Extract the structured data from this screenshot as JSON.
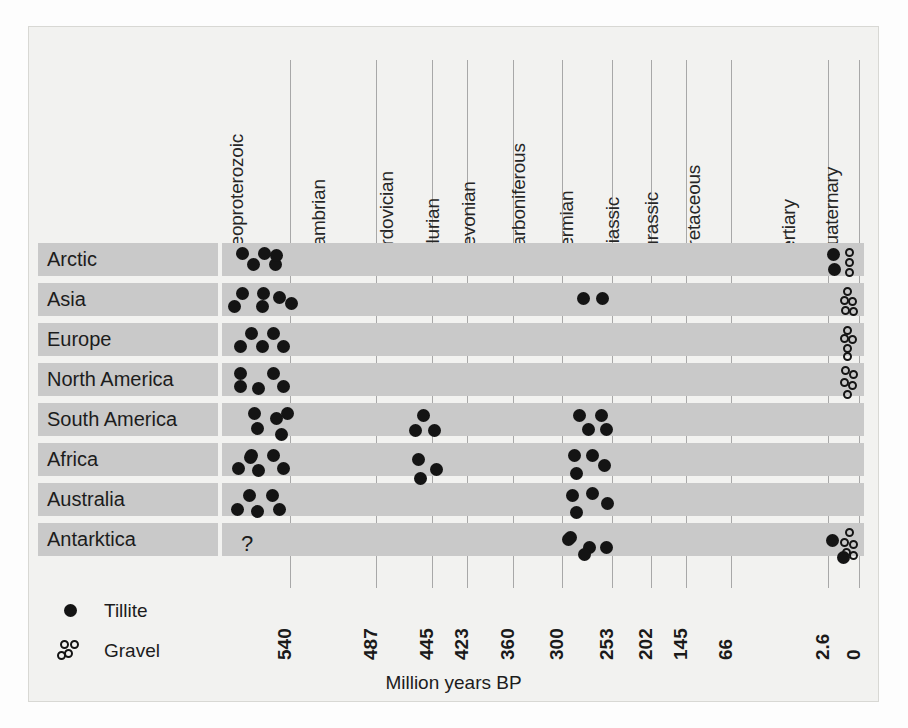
{
  "chart_data": {
    "type": "scatter",
    "title": "",
    "xlabel": "Million years BP",
    "ylabel": "",
    "grid": true,
    "legend_position": "bottom-left",
    "x_axis": {
      "label": "Million years BP",
      "direction": "reversed",
      "ticks": [
        "540",
        "487",
        "445",
        "423",
        "360",
        "300",
        "253",
        "202",
        "145",
        "66",
        "2.6",
        "0"
      ],
      "tick_values": [
        540,
        487,
        445,
        423,
        360,
        300,
        253,
        202,
        145,
        66,
        2.6,
        0
      ]
    },
    "periods": [
      "Neoproterozoic",
      "Cambrian",
      "Ordovician",
      "Silurian",
      "Devonian",
      "Carboniferous",
      "Permian",
      "Triassic",
      "Jurassic",
      "Cretaceous",
      "Tertiary",
      "Quaternary"
    ],
    "categories": [
      "Arctic",
      "Asia",
      "Europe",
      "North America",
      "South America",
      "Africa",
      "Australia",
      "Antarktica"
    ],
    "legend": [
      {
        "label": "Tillite",
        "marker": "filled-circle"
      },
      {
        "label": "Gravel",
        "marker": "open-circle-cluster"
      }
    ],
    "annotations": [
      {
        "row": "Antarktica",
        "period": "Neoproterozoic",
        "text": "?"
      }
    ],
    "series": [
      {
        "name": "Tillite",
        "marker": "filled-circle",
        "color": "#141414",
        "points": [
          {
            "row": "Arctic",
            "period": "Neoproterozoic",
            "count": 5
          },
          {
            "row": "Arctic",
            "period": "Quaternary",
            "count": 2
          },
          {
            "row": "Asia",
            "period": "Neoproterozoic",
            "count": 6
          },
          {
            "row": "Asia",
            "period": "Carboniferous-Permian",
            "count": 2
          },
          {
            "row": "Europe",
            "period": "Neoproterozoic",
            "count": 5
          },
          {
            "row": "North America",
            "period": "Neoproterozoic",
            "count": 5
          },
          {
            "row": "South America",
            "period": "Neoproterozoic",
            "count": 5
          },
          {
            "row": "South America",
            "period": "Ordovician-Silurian",
            "count": 3
          },
          {
            "row": "South America",
            "period": "Carboniferous-Permian",
            "count": 4
          },
          {
            "row": "Africa",
            "period": "Neoproterozoic",
            "count": 6
          },
          {
            "row": "Africa",
            "period": "Ordovician-Silurian",
            "count": 3
          },
          {
            "row": "Africa",
            "period": "Carboniferous-Permian",
            "count": 4
          },
          {
            "row": "Australia",
            "period": "Neoproterozoic",
            "count": 5
          },
          {
            "row": "Australia",
            "period": "Carboniferous-Permian",
            "count": 5
          },
          {
            "row": "Antarktica",
            "period": "Carboniferous-Permian",
            "count": 5
          },
          {
            "row": "Antarktica",
            "period": "Quaternary",
            "count": 2
          }
        ]
      },
      {
        "name": "Gravel",
        "marker": "open-circle",
        "color": "#141414",
        "points": [
          {
            "row": "Arctic",
            "period": "Quaternary",
            "count": 3
          },
          {
            "row": "Asia",
            "period": "Quaternary",
            "count": 5
          },
          {
            "row": "Europe",
            "period": "Quaternary",
            "count": 5
          },
          {
            "row": "North America",
            "period": "Quaternary",
            "count": 5
          },
          {
            "row": "Antarktica",
            "period": "Quaternary",
            "count": 5
          }
        ]
      }
    ]
  },
  "axis_title": "Million years BP",
  "legend": {
    "tillite_label": "Tillite",
    "gravel_label": "Gravel"
  },
  "periods": [
    {
      "label": "Neoproterozoic"
    },
    {
      "label": "Cambrian"
    },
    {
      "label": "Ordovician"
    },
    {
      "label": "Silurian"
    },
    {
      "label": "Devonian"
    },
    {
      "label": "Carboniferous"
    },
    {
      "label": "Permian"
    },
    {
      "label": "Triassic"
    },
    {
      "label": "Jurassic"
    },
    {
      "label": "Cretaceous"
    },
    {
      "label": "Tertiary"
    },
    {
      "label": "Quaternary"
    }
  ],
  "rows": [
    {
      "label": "Arctic"
    },
    {
      "label": "Asia"
    },
    {
      "label": "Europe"
    },
    {
      "label": "North America"
    },
    {
      "label": "South America"
    },
    {
      "label": "Africa"
    },
    {
      "label": "Australia"
    },
    {
      "label": "Antarktica"
    }
  ],
  "ticks": [
    {
      "label": "540"
    },
    {
      "label": "487"
    },
    {
      "label": "445"
    },
    {
      "label": "423"
    },
    {
      "label": "360"
    },
    {
      "label": "300"
    },
    {
      "label": "253"
    },
    {
      "label": "202"
    },
    {
      "label": "145"
    },
    {
      "label": "66"
    },
    {
      "label": "2.6"
    },
    {
      "label": "0"
    }
  ],
  "annotation_unknown": "?",
  "colors": {
    "band": "#c9c9c9",
    "marker": "#141414",
    "gridline": "#a8a8a8",
    "plate": "#f2f2f0"
  },
  "layout": {
    "period_label_x": [
      248,
      330,
      398,
      444,
      480,
      530,
      578,
      624,
      663,
      705,
      800,
      843
    ],
    "period_label_baseline": 238,
    "gridline_x": [
      290,
      376,
      432,
      467,
      513,
      562,
      612,
      651,
      686,
      731,
      828,
      859
    ],
    "gridline_top": 60,
    "gridline_bottom": 588,
    "row_top": [
      243,
      283,
      323,
      363,
      403,
      443,
      483,
      523
    ],
    "row_label_left": 38,
    "row_label_width": 180,
    "band_left": 222,
    "band_right": 864,
    "tick_x": [
      296,
      382,
      438,
      473,
      519,
      568,
      618,
      657,
      692,
      737,
      834,
      865
    ],
    "tick_baseline": 638,
    "legend_x_marker": 64,
    "legend_x_label": 104,
    "legend_y": [
      604,
      644
    ]
  },
  "markers": {
    "tillite": [
      {
        "row": 0,
        "x": 236,
        "y": 247
      },
      {
        "row": 0,
        "x": 258,
        "y": 247
      },
      {
        "row": 0,
        "x": 247,
        "y": 258
      },
      {
        "row": 0,
        "x": 269,
        "y": 258
      },
      {
        "row": 0,
        "x": 270,
        "y": 249
      },
      {
        "row": 0,
        "x": 827,
        "y": 248
      },
      {
        "row": 0,
        "x": 828,
        "y": 263
      },
      {
        "row": 1,
        "x": 236,
        "y": 287
      },
      {
        "row": 1,
        "x": 257,
        "y": 287
      },
      {
        "row": 1,
        "x": 228,
        "y": 300
      },
      {
        "row": 1,
        "x": 256,
        "y": 300
      },
      {
        "row": 1,
        "x": 273,
        "y": 291
      },
      {
        "row": 1,
        "x": 285,
        "y": 297
      },
      {
        "row": 1,
        "x": 577,
        "y": 292
      },
      {
        "row": 1,
        "x": 596,
        "y": 292
      },
      {
        "row": 2,
        "x": 245,
        "y": 327
      },
      {
        "row": 2,
        "x": 267,
        "y": 327
      },
      {
        "row": 2,
        "x": 234,
        "y": 340
      },
      {
        "row": 2,
        "x": 256,
        "y": 340
      },
      {
        "row": 2,
        "x": 277,
        "y": 340
      },
      {
        "row": 3,
        "x": 234,
        "y": 367
      },
      {
        "row": 3,
        "x": 267,
        "y": 367
      },
      {
        "row": 3,
        "x": 234,
        "y": 380
      },
      {
        "row": 3,
        "x": 252,
        "y": 382
      },
      {
        "row": 3,
        "x": 277,
        "y": 380
      },
      {
        "row": 4,
        "x": 248,
        "y": 407
      },
      {
        "row": 4,
        "x": 270,
        "y": 412
      },
      {
        "row": 4,
        "x": 281,
        "y": 407
      },
      {
        "row": 4,
        "x": 251,
        "y": 422
      },
      {
        "row": 4,
        "x": 275,
        "y": 428
      },
      {
        "row": 4,
        "x": 417,
        "y": 409
      },
      {
        "row": 4,
        "x": 409,
        "y": 424
      },
      {
        "row": 4,
        "x": 428,
        "y": 424
      },
      {
        "row": 4,
        "x": 573,
        "y": 409
      },
      {
        "row": 4,
        "x": 595,
        "y": 409
      },
      {
        "row": 4,
        "x": 582,
        "y": 423
      },
      {
        "row": 4,
        "x": 600,
        "y": 423
      },
      {
        "row": 5,
        "x": 245,
        "y": 449
      },
      {
        "row": 5,
        "x": 267,
        "y": 449
      },
      {
        "row": 5,
        "x": 232,
        "y": 462
      },
      {
        "row": 5,
        "x": 252,
        "y": 464
      },
      {
        "row": 5,
        "x": 277,
        "y": 462
      },
      {
        "row": 5,
        "x": 244,
        "y": 451
      },
      {
        "row": 5,
        "x": 412,
        "y": 453
      },
      {
        "row": 5,
        "x": 430,
        "y": 463
      },
      {
        "row": 5,
        "x": 414,
        "y": 472
      },
      {
        "row": 5,
        "x": 568,
        "y": 449
      },
      {
        "row": 5,
        "x": 586,
        "y": 449
      },
      {
        "row": 5,
        "x": 598,
        "y": 459
      },
      {
        "row": 5,
        "x": 570,
        "y": 467
      },
      {
        "row": 6,
        "x": 243,
        "y": 489
      },
      {
        "row": 6,
        "x": 266,
        "y": 489
      },
      {
        "row": 6,
        "x": 231,
        "y": 503
      },
      {
        "row": 6,
        "x": 251,
        "y": 505
      },
      {
        "row": 6,
        "x": 273,
        "y": 503
      },
      {
        "row": 6,
        "x": 566,
        "y": 489
      },
      {
        "row": 6,
        "x": 586,
        "y": 487
      },
      {
        "row": 6,
        "x": 601,
        "y": 497
      },
      {
        "row": 6,
        "x": 570,
        "y": 506
      },
      {
        "row": 7,
        "x": 564,
        "y": 531
      },
      {
        "row": 7,
        "x": 583,
        "y": 541
      },
      {
        "row": 7,
        "x": 600,
        "y": 541
      },
      {
        "row": 7,
        "x": 578,
        "y": 548
      },
      {
        "row": 7,
        "x": 562,
        "y": 533
      },
      {
        "row": 7,
        "x": 826,
        "y": 534
      },
      {
        "row": 7,
        "x": 837,
        "y": 551
      }
    ],
    "gravel": [
      {
        "row": 0,
        "x": 845,
        "y": 248
      },
      {
        "row": 0,
        "x": 845,
        "y": 258
      },
      {
        "row": 0,
        "x": 845,
        "y": 268
      },
      {
        "row": 1,
        "x": 843,
        "y": 287
      },
      {
        "row": 1,
        "x": 840,
        "y": 296
      },
      {
        "row": 1,
        "x": 848,
        "y": 297
      },
      {
        "row": 1,
        "x": 841,
        "y": 306
      },
      {
        "row": 1,
        "x": 849,
        "y": 307
      },
      {
        "row": 2,
        "x": 843,
        "y": 326
      },
      {
        "row": 2,
        "x": 840,
        "y": 334
      },
      {
        "row": 2,
        "x": 848,
        "y": 335
      },
      {
        "row": 2,
        "x": 843,
        "y": 344
      },
      {
        "row": 2,
        "x": 843,
        "y": 352
      },
      {
        "row": 3,
        "x": 841,
        "y": 366
      },
      {
        "row": 3,
        "x": 849,
        "y": 370
      },
      {
        "row": 3,
        "x": 840,
        "y": 378
      },
      {
        "row": 3,
        "x": 848,
        "y": 381
      },
      {
        "row": 3,
        "x": 843,
        "y": 390
      },
      {
        "row": 7,
        "x": 845,
        "y": 528
      },
      {
        "row": 7,
        "x": 840,
        "y": 538
      },
      {
        "row": 7,
        "x": 849,
        "y": 540
      },
      {
        "row": 7,
        "x": 842,
        "y": 548
      },
      {
        "row": 7,
        "x": 849,
        "y": 551
      }
    ],
    "legend_gravel_cluster": [
      {
        "x": 60,
        "y": 640
      },
      {
        "x": 70,
        "y": 640
      },
      {
        "x": 64,
        "y": 649
      },
      {
        "x": 57,
        "y": 651
      }
    ]
  }
}
